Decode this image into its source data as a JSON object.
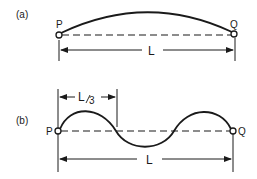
{
  "figure": {
    "panel_a": {
      "label": "(a)",
      "left_point": "P",
      "right_point": "Q",
      "length_label": "L",
      "description": "Single half-wave arc between fixed ends P and Q"
    },
    "panel_b": {
      "label": "(b)",
      "left_point": "P",
      "right_point": "Q",
      "length_label": "L",
      "segment_label_main": "L",
      "segment_label_sub": "3",
      "segment_label": "L/3",
      "description": "Three half-wave standing wave between fixed ends P and Q"
    },
    "colors": {
      "line": "#1a1a1a",
      "background": "#ffffff"
    }
  }
}
